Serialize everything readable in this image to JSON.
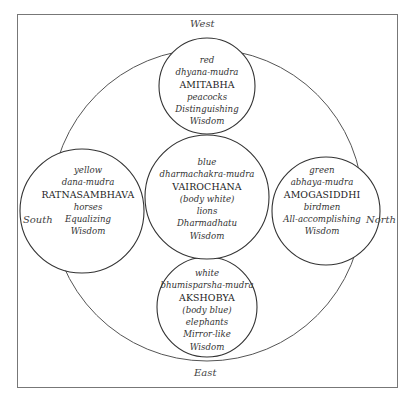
{
  "diagram": {
    "directions": {
      "top": "West",
      "bottom": "East",
      "left": "South",
      "right": "North"
    },
    "buddhas": [
      {
        "position": "top",
        "color": "red",
        "mudra": "dhyana-mudra",
        "name": "AMITABHA",
        "animal": "peacocks",
        "wisdom_line1": "Distinguishing",
        "wisdom_line2": "Wisdom"
      },
      {
        "position": "center",
        "color": "blue",
        "mudra": "dharmachakra-mudra",
        "name": "VAIROCHANA",
        "body": "(body white)",
        "animal": "lions",
        "wisdom_line1": "Dharmadhatu",
        "wisdom_line2": "Wisdom"
      },
      {
        "position": "left",
        "color": "yellow",
        "mudra": "dana-mudra",
        "name": "RATNASAMBHAVA",
        "animal": "horses",
        "wisdom_line1": "Equalizing",
        "wisdom_line2": "Wisdom"
      },
      {
        "position": "right",
        "color": "green",
        "mudra": "abhaya-mudra",
        "name": "AMOGASIDDHI",
        "animal": "birdmen",
        "wisdom_line1": "All-accomplishing",
        "wisdom_line2": "Wisdom"
      },
      {
        "position": "bottom",
        "color": "white",
        "mudra": "bhumisparsha-mudra",
        "name": "AKSHOBYA",
        "body": "(body blue)",
        "animal": "elephants",
        "wisdom_line1": "Mirror-like",
        "wisdom_line2": "Wisdom"
      }
    ],
    "colors": {
      "line": "#444444",
      "frame": "#777777",
      "text": "#333333"
    }
  }
}
